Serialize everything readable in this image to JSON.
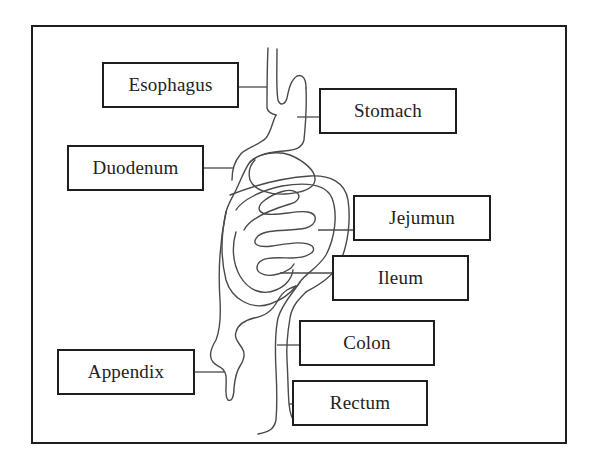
{
  "diagram": {
    "type": "labeled-anatomy",
    "labels": [
      {
        "id": "esophagus",
        "text": "Esophagus",
        "box": {
          "x": 102,
          "y": 62,
          "w": 137,
          "h": 46
        }
      },
      {
        "id": "stomach",
        "text": "Stomach",
        "box": {
          "x": 319,
          "y": 88,
          "w": 138,
          "h": 46
        }
      },
      {
        "id": "duodenum",
        "text": "Duodenum",
        "box": {
          "x": 67,
          "y": 145,
          "w": 137,
          "h": 46
        }
      },
      {
        "id": "jejumun",
        "text": "Jejumun",
        "box": {
          "x": 353,
          "y": 195,
          "w": 138,
          "h": 46
        }
      },
      {
        "id": "ileum",
        "text": "Ileum",
        "box": {
          "x": 332,
          "y": 255,
          "w": 137,
          "h": 46
        }
      },
      {
        "id": "colon",
        "text": "Colon",
        "box": {
          "x": 299,
          "y": 320,
          "w": 136,
          "h": 46
        }
      },
      {
        "id": "rectum",
        "text": "Rectum",
        "box": {
          "x": 292,
          "y": 380,
          "w": 136,
          "h": 46
        }
      },
      {
        "id": "appendix",
        "text": "Appendix",
        "box": {
          "x": 57,
          "y": 349,
          "w": 138,
          "h": 46
        }
      }
    ],
    "colors": {
      "line": "#4a4a4a",
      "border": "#1e1e1e",
      "text": "#222222",
      "background": "#ffffff"
    }
  }
}
